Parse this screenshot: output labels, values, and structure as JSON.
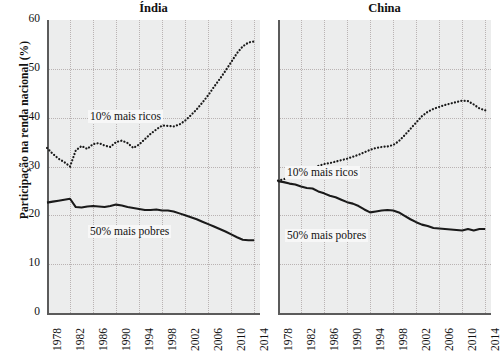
{
  "axis": {
    "ylabel": "Participação na renda nacional (%)",
    "yticks": [
      0,
      10,
      20,
      30,
      40,
      50,
      60
    ],
    "xticks": [
      1978,
      1982,
      1986,
      1990,
      1994,
      1998,
      2002,
      2006,
      2010,
      2014
    ],
    "ylim": [
      0,
      60
    ],
    "xlim": [
      1978,
      2015
    ]
  },
  "series_labels": {
    "rich": "10% mais ricos",
    "poor": "50% mais pobres"
  },
  "panels": [
    {
      "title": "Índia"
    },
    {
      "title": "China"
    }
  ],
  "chart_data": {
    "type": "line",
    "title": "",
    "xlabel": "",
    "ylabel": "Participação na renda nacional (%)",
    "ylim": [
      0,
      60
    ],
    "xlim": [
      1978,
      2015
    ],
    "yticks": [
      0,
      10,
      20,
      30,
      40,
      50,
      60
    ],
    "xticks": [
      1978,
      1982,
      1986,
      1990,
      1994,
      1998,
      2002,
      2006,
      2010,
      2014
    ],
    "grid": true,
    "legend": "inline-annotation",
    "panels": [
      {
        "name": "Índia",
        "x": [
          1978,
          1979,
          1980,
          1981,
          1982,
          1983,
          1984,
          1985,
          1986,
          1987,
          1988,
          1989,
          1990,
          1991,
          1992,
          1993,
          1994,
          1995,
          1996,
          1997,
          1998,
          1999,
          2000,
          2001,
          2002,
          2003,
          2004,
          2005,
          2006,
          2007,
          2008,
          2009,
          2010,
          2011,
          2012,
          2013,
          2014
        ],
        "series": [
          {
            "name": "10% mais ricos",
            "style": "dotted",
            "values": [
              33.8,
              32.6,
              31.6,
              30.9,
              30.0,
              33.3,
              34.2,
              33.6,
              34.6,
              34.8,
              34.3,
              34.0,
              35.0,
              35.3,
              34.8,
              33.8,
              34.5,
              35.6,
              36.7,
              37.6,
              38.4,
              38.3,
              38.2,
              38.6,
              39.4,
              40.5,
              41.7,
              43.1,
              44.6,
              46.3,
              47.9,
              49.6,
              51.4,
              53.2,
              54.6,
              55.4,
              55.6
            ]
          },
          {
            "name": "50% mais pobres",
            "style": "solid",
            "values": [
              22.6,
              22.8,
              23.0,
              23.2,
              23.4,
              21.7,
              21.6,
              21.8,
              21.9,
              21.8,
              21.7,
              21.9,
              22.2,
              22.0,
              21.7,
              21.5,
              21.3,
              21.1,
              21.1,
              21.2,
              21.0,
              21.0,
              20.8,
              20.4,
              20.0,
              19.6,
              19.2,
              18.7,
              18.2,
              17.7,
              17.2,
              16.7,
              16.1,
              15.5,
              15.0,
              14.9,
              14.9
            ]
          }
        ]
      },
      {
        "name": "China",
        "x": [
          1978,
          1979,
          1980,
          1981,
          1982,
          1983,
          1984,
          1985,
          1986,
          1987,
          1988,
          1989,
          1990,
          1991,
          1992,
          1993,
          1994,
          1995,
          1996,
          1997,
          1998,
          1999,
          2000,
          2001,
          2002,
          2003,
          2004,
          2005,
          2006,
          2007,
          2008,
          2009,
          2010,
          2011,
          2012,
          2013,
          2014
        ],
        "series": [
          {
            "name": "10% mais ricos",
            "style": "dotted",
            "values": [
              27.1,
              27.4,
              27.8,
              28.2,
              28.6,
              29.1,
              29.6,
              30.1,
              30.5,
              30.7,
              31.0,
              31.3,
              31.6,
              32.0,
              32.4,
              32.9,
              33.4,
              33.8,
              34.0,
              34.1,
              34.4,
              35.2,
              36.4,
              37.7,
              39.0,
              40.3,
              41.2,
              41.8,
              42.2,
              42.6,
              42.9,
              43.2,
              43.5,
              43.4,
              42.7,
              41.9,
              41.5
            ]
          },
          {
            "name": "50% mais pobres",
            "style": "solid",
            "values": [
              27.0,
              26.8,
              26.5,
              26.3,
              25.9,
              25.6,
              25.5,
              24.9,
              24.5,
              24.0,
              23.7,
              23.2,
              22.7,
              22.4,
              21.9,
              21.2,
              20.6,
              20.8,
              21.0,
              21.1,
              21.0,
              20.6,
              19.9,
              19.2,
              18.6,
              18.1,
              17.8,
              17.4,
              17.3,
              17.2,
              17.1,
              17.0,
              16.9,
              17.2,
              16.9,
              17.2,
              17.2
            ]
          }
        ]
      }
    ]
  }
}
